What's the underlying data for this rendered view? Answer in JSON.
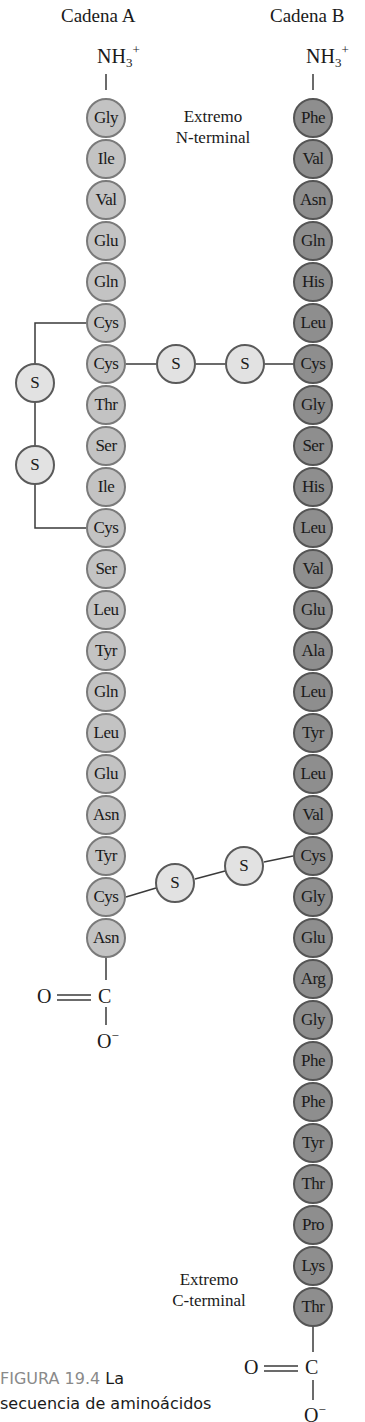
{
  "chain_a": {
    "title": "Cadena A",
    "n_terminus": {
      "base": "NH",
      "sub": "3",
      "sup": "+"
    },
    "residues": [
      "Gly",
      "Ile",
      "Val",
      "Glu",
      "Gln",
      "Cys",
      "Cys",
      "Thr",
      "Ser",
      "Ile",
      "Cys",
      "Ser",
      "Leu",
      "Tyr",
      "Gln",
      "Leu",
      "Glu",
      "Asn",
      "Tyr",
      "Cys",
      "Asn"
    ],
    "c_terminus": {
      "carbonyl_o": "O",
      "carbon": "C",
      "oxide": "O",
      "oxide_charge": "−"
    }
  },
  "chain_b": {
    "title": "Cadena B",
    "n_terminus": {
      "base": "NH",
      "sub": "3",
      "sup": "+"
    },
    "residues": [
      "Phe",
      "Val",
      "Asn",
      "Gln",
      "His",
      "Leu",
      "Cys",
      "Gly",
      "Ser",
      "His",
      "Leu",
      "Val",
      "Glu",
      "Ala",
      "Leu",
      "Tyr",
      "Leu",
      "Val",
      "Cys",
      "Gly",
      "Glu",
      "Arg",
      "Gly",
      "Phe",
      "Phe",
      "Tyr",
      "Thr",
      "Pro",
      "Lys",
      "Thr"
    ],
    "c_terminus": {
      "carbonyl_o": "O",
      "carbon": "C",
      "oxide": "O",
      "oxide_charge": "−"
    }
  },
  "disulfide_bridges": [
    {
      "type": "intrachain",
      "from": "A6 Cys",
      "to": "A11 Cys",
      "atoms": [
        "S",
        "S"
      ]
    },
    {
      "type": "interchain",
      "from": "A7 Cys",
      "to": "B7 Cys",
      "atoms": [
        "S",
        "S"
      ]
    },
    {
      "type": "interchain",
      "from": "A20 Cys",
      "to": "B19 Cys",
      "atoms": [
        "S",
        "S"
      ]
    }
  ],
  "labels": {
    "n_terminal": [
      "Extremo",
      "N-terminal"
    ],
    "c_terminal": [
      "Extremo",
      "C-terminal"
    ]
  },
  "caption": {
    "figure_number": "FIGURA 19.4",
    "line1_rest": "La",
    "line2": "secuencia de aminoácidos"
  },
  "colors": {
    "chain_a_fill": "#c3c3c3",
    "chain_b_fill": "#8e8e8e",
    "sulfur_fill": "#e2e2e2",
    "figure_number": "#8a8a8a"
  }
}
